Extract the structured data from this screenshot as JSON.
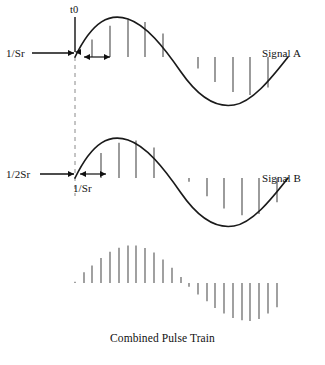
{
  "figure": {
    "caption": "Combined Pulse Train",
    "labels": {
      "t0": "t0",
      "inv_sr_a": "1/Sr",
      "inv_2sr_b": "1/2Sr",
      "inv_sr_b": "1/Sr",
      "signal_a": "Signal A",
      "signal_b": "Signal B"
    },
    "colors": {
      "curve": "#1a1a1a",
      "pulse": "#4a4a4a",
      "pulse_combined": "#6e6e6e",
      "dashed_guide": "#8a8a8a",
      "text": "#111111",
      "background": "#ffffff"
    }
  },
  "chart_data": {
    "type": "line",
    "title": "Combined Pulse Train",
    "xlabel": "",
    "ylabel": "",
    "grid": false,
    "legend_position": "right",
    "annotations": [
      {
        "text": "t0",
        "x": 75,
        "y": 14,
        "kind": "arrow-down-marker"
      },
      {
        "text": "1/Sr",
        "x": 10,
        "y": 53,
        "kind": "arrow-right-to-origin"
      },
      {
        "text": "1/Sr",
        "x": 95,
        "y": 57,
        "kind": "double-arrow-span"
      },
      {
        "text": "1/2Sr",
        "x": 10,
        "y": 174,
        "kind": "arrow-right-to-origin"
      },
      {
        "text": "1/Sr",
        "x": 95,
        "y": 188,
        "kind": "double-arrow-span"
      }
    ],
    "series": [
      {
        "name": "Signal A",
        "type": "sine",
        "baseline_y": 57,
        "amplitude": 38,
        "x_start": 75,
        "x_end": 288,
        "period_px": 213,
        "phase": 0,
        "sample_offset_px": 0,
        "sample_step_px": 17.5,
        "samples_x": [
          92,
          110,
          128,
          145,
          163,
          198,
          215,
          233,
          250,
          268
        ],
        "samples_value": [
          0.46,
          0.82,
          0.99,
          0.92,
          0.62,
          -0.3,
          -0.66,
          -0.92,
          -1.0,
          -0.8
        ]
      },
      {
        "name": "Signal B",
        "type": "sine",
        "baseline_y": 178,
        "amplitude": 38,
        "x_start": 75,
        "x_end": 288,
        "period_px": 213,
        "phase": 0,
        "sample_offset_px": 8.75,
        "sample_step_px": 17.5,
        "samples_x": [
          101,
          119,
          136,
          154,
          189,
          207,
          224,
          242,
          259,
          277
        ],
        "samples_value": [
          0.66,
          0.93,
          0.99,
          0.8,
          -0.1,
          -0.48,
          -0.8,
          -0.98,
          -0.95,
          -0.64
        ]
      },
      {
        "name": "Combined Pulse Train",
        "type": "stem",
        "baseline_y": 283,
        "amplitude": 38,
        "samples_x": [
          75,
          84,
          92,
          101,
          110,
          119,
          128,
          136,
          145,
          154,
          163,
          172,
          181,
          189,
          198,
          207,
          215,
          224,
          233,
          242,
          250,
          259,
          268,
          277
        ],
        "samples_value": [
          0.03,
          0.28,
          0.46,
          0.66,
          0.82,
          0.93,
          0.99,
          0.99,
          0.92,
          0.8,
          0.62,
          0.4,
          0.16,
          -0.1,
          -0.3,
          -0.48,
          -0.66,
          -0.8,
          -0.92,
          -0.98,
          -1.0,
          -0.95,
          -0.8,
          -0.64
        ]
      }
    ]
  }
}
